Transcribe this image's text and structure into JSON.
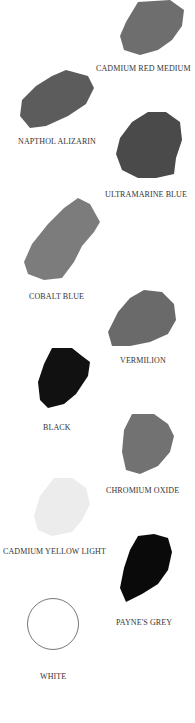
{
  "swatches": [
    {
      "name": "Cadmium Red Medium",
      "color": "#6e6e6e"
    },
    {
      "name": "Napthol Alizarin",
      "color": "#5c5c5c"
    },
    {
      "name": "Ultramarine Blue",
      "color": "#4a4a4a"
    },
    {
      "name": "Cobalt Blue",
      "color": "#7c7c7c"
    },
    {
      "name": "Vermilion",
      "color": "#6a6a6a"
    },
    {
      "name": "Black",
      "color": "#111111"
    },
    {
      "name": "Chromium Oxide",
      "color": "#727272"
    },
    {
      "name": "Cadmium Yellow Light",
      "color": "#ececec"
    },
    {
      "name": "Payne's Grey",
      "color": "#0a0a0a"
    },
    {
      "name": "White",
      "color": "#ffffff"
    }
  ],
  "labels": {
    "cadmium_red_medium": "CADMIUM RED MEDIUM",
    "napthol_alizarin": "NAPTHOL ALIZARIN",
    "ultramarine_blue": "ULTRAMARINE BLUE",
    "cobalt_blue": "COBALT BLUE",
    "vermilion": "VERMILION",
    "black": "BLACK",
    "chromium_oxide": "CHROMIUM OXIDE",
    "cadmium_yellow_light": "CADMIUM YELLOW LIGHT",
    "paynes_grey": "PAYNE'S GREY",
    "white": "WHITE"
  }
}
